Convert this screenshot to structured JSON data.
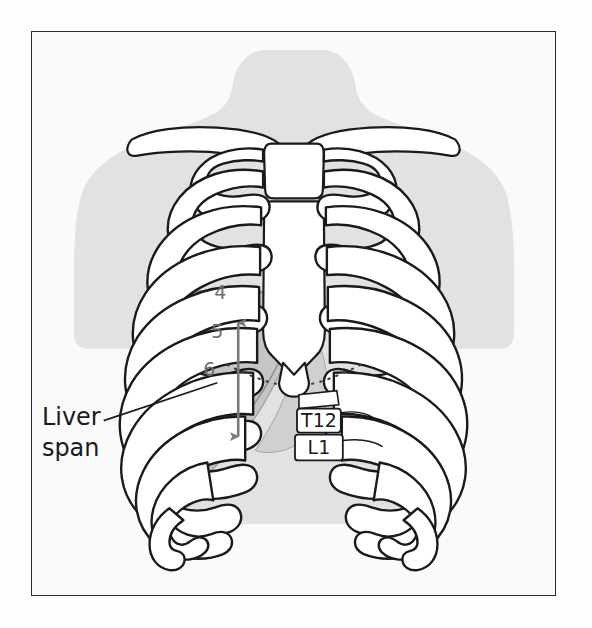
{
  "figure": {
    "kind": "anatomical-illustration",
    "frame": {
      "border_color": "#2b2b2b",
      "background_color": "#fafafa"
    },
    "page_background": "#ffffff"
  },
  "palette": {
    "body_silhouette": "#e2e2e2",
    "bone_fill": "#ffffff",
    "bone_outline": "#1a1a1a",
    "liver_fill": "#bfbfbf",
    "liver_outline": "#8a8a8a",
    "arrow_color": "#7a7a7a",
    "leader_line": "#1a1a1a",
    "label_dark": "#1a1a1a",
    "label_gray": "#6e6e6e"
  },
  "labels": {
    "liver_span": {
      "line1": "Liver",
      "line2": "span"
    },
    "ribs": [
      {
        "id": "rib-4",
        "text": "4"
      },
      {
        "id": "rib-5",
        "text": "5"
      },
      {
        "id": "rib-6",
        "text": "6"
      }
    ],
    "vertebrae": [
      {
        "id": "vertebra-t12",
        "text": "T12"
      },
      {
        "id": "vertebra-l1",
        "text": "L1"
      }
    ]
  },
  "annotations": {
    "liver_span_arrow": {
      "type": "double-headed-arrow",
      "orientation": "vertical",
      "top_level": "5th rib midclavicular line",
      "bottom_level": "inferior liver edge"
    },
    "leader_line": {
      "from": "Liver span label",
      "to": "liver shadow"
    }
  },
  "anatomy": {
    "rib_pairs": 12,
    "structures": [
      "clavicle-left",
      "clavicle-right",
      "manubrium",
      "sternum-body",
      "xiphoid-process",
      "costal-margin",
      "liver",
      "vertebra-T12",
      "vertebra-L1",
      "floating-ribs"
    ]
  }
}
